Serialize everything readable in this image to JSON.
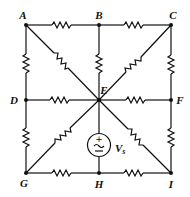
{
  "diagram": {
    "type": "resistor-network",
    "colors": {
      "line": "#111111",
      "background": "#ffffff"
    },
    "nodes": [
      {
        "id": "A",
        "label": "A",
        "x": 26,
        "y": 25
      },
      {
        "id": "B",
        "label": "B",
        "x": 99,
        "y": 25
      },
      {
        "id": "C",
        "label": "C",
        "x": 171,
        "y": 25
      },
      {
        "id": "D",
        "label": "D",
        "x": 26,
        "y": 100
      },
      {
        "id": "E",
        "label": "E",
        "x": 99,
        "y": 100
      },
      {
        "id": "F",
        "label": "F",
        "x": 171,
        "y": 100
      },
      {
        "id": "G",
        "label": "G",
        "x": 26,
        "y": 173
      },
      {
        "id": "H",
        "label": "H",
        "x": 99,
        "y": 173
      },
      {
        "id": "I",
        "label": "I",
        "x": 171,
        "y": 173
      }
    ],
    "resistors": [
      {
        "from": "A",
        "to": "B"
      },
      {
        "from": "B",
        "to": "C"
      },
      {
        "from": "A",
        "to": "D"
      },
      {
        "from": "C",
        "to": "F"
      },
      {
        "from": "D",
        "to": "G"
      },
      {
        "from": "F",
        "to": "I"
      },
      {
        "from": "G",
        "to": "H"
      },
      {
        "from": "H",
        "to": "I"
      },
      {
        "from": "D",
        "to": "E"
      },
      {
        "from": "E",
        "to": "F"
      },
      {
        "from": "B",
        "to": "E"
      },
      {
        "from": "A",
        "to": "E"
      },
      {
        "from": "C",
        "to": "E"
      },
      {
        "from": "G",
        "to": "E"
      },
      {
        "from": "I",
        "to": "E"
      }
    ],
    "source": {
      "label": "V",
      "subscript": "s",
      "between": [
        "E",
        "H"
      ],
      "type": "ac-voltage-source",
      "plus_sign": "+",
      "minus_sign": "−",
      "ac_symbol": "~"
    }
  }
}
